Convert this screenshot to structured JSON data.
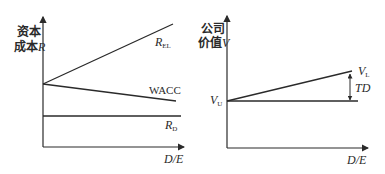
{
  "diagram": {
    "left_panel": {
      "y_axis_label_line1": "资本",
      "y_axis_label_line2": "成本",
      "y_axis_var": "R",
      "x_axis_label": "D/E",
      "lines": [
        {
          "name": "R_EL",
          "label_main": "R",
          "label_sub": "EL",
          "trend": "increasing"
        },
        {
          "name": "WACC",
          "label_main": "WACC",
          "label_sub": "",
          "trend": "decreasing"
        },
        {
          "name": "R_D",
          "label_main": "R",
          "label_sub": "D",
          "trend": "flat"
        }
      ]
    },
    "right_panel": {
      "y_axis_label_line1": "公司",
      "y_axis_label_line2": "价值",
      "y_axis_var": "V",
      "x_axis_label": "D/E",
      "vu_label_main": "V",
      "vu_label_sub": "U",
      "vl_label_main": "V",
      "vl_label_sub": "L",
      "gap_label": "TD",
      "lines": [
        {
          "name": "V_L",
          "trend": "increasing"
        },
        {
          "name": "V_U",
          "trend": "flat"
        }
      ]
    },
    "colors": {
      "line": "#2a2a2a",
      "background": "#ffffff"
    }
  }
}
